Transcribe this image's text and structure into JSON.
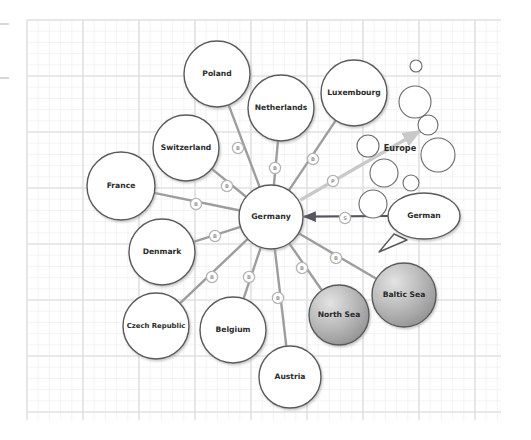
{
  "canvas": {
    "width": 531,
    "height": 440,
    "background": "#ffffff",
    "grid": {
      "minor_spacing": 11.2,
      "major_spacing": 56,
      "minor_color": "#f0f0f2",
      "major_color": "#e2e2e6",
      "left": 27,
      "top": 20,
      "right": 501,
      "bottom": 420
    },
    "margin_ticks": [
      {
        "x1": 0,
        "y": 24,
        "x2": 9,
        "color": "#bdbdbd"
      },
      {
        "x1": 0,
        "y": 78,
        "x2": 9,
        "color": "#bdbdbd"
      }
    ]
  },
  "diagram": {
    "type": "node-link-mindmap",
    "center_node": "Germany",
    "colors": {
      "node_stroke": "#5a5a5a",
      "node_fill": "#ffffff",
      "node_text": "#2b2b2b",
      "edge_default": "#9d9d9d",
      "edge_highlight_dark": "#555560",
      "edge_highlight_light": "#c9c9c9",
      "badge_stroke": "#b4b4b4",
      "badge_fill": "#ffffff",
      "badge_text": "#9a9a9a",
      "sea_fill_light": "#d9d9d9",
      "sea_fill_dark": "#8f8f8f",
      "sea_stroke": "#5a5a5a",
      "cluster_stroke": "#6b6b6b"
    },
    "nodes": [
      {
        "id": "germany",
        "label": "Germany",
        "cx": 271,
        "cy": 217,
        "r": 32,
        "style": "plain"
      },
      {
        "id": "poland",
        "label": "Poland",
        "cx": 217,
        "cy": 74,
        "r": 33,
        "style": "plain"
      },
      {
        "id": "netherlands",
        "label": "Netherlands",
        "cx": 281,
        "cy": 108,
        "r": 33,
        "style": "plain"
      },
      {
        "id": "luxembourg",
        "label": "Luxembourg",
        "cx": 354,
        "cy": 93,
        "r": 33,
        "style": "plain"
      },
      {
        "id": "switzerland",
        "label": "Switzerland",
        "cx": 186,
        "cy": 148,
        "r": 33,
        "style": "plain"
      },
      {
        "id": "france",
        "label": "France",
        "cx": 121,
        "cy": 186,
        "r": 34,
        "style": "plain"
      },
      {
        "id": "denmark",
        "label": "Denmark",
        "cx": 162,
        "cy": 252,
        "r": 33,
        "style": "plain"
      },
      {
        "id": "czech_republic",
        "label": "Czech Republic",
        "cx": 156,
        "cy": 326,
        "r": 33,
        "style": "plain"
      },
      {
        "id": "belgium",
        "label": "Belgium",
        "cx": 233,
        "cy": 330,
        "r": 33,
        "style": "plain"
      },
      {
        "id": "austria",
        "label": "Austria",
        "cx": 290,
        "cy": 377,
        "r": 31,
        "style": "plain"
      },
      {
        "id": "north_sea",
        "label": "North Sea",
        "cx": 339,
        "cy": 315,
        "r": 30,
        "style": "shaded"
      },
      {
        "id": "baltic_sea",
        "label": "Baltic Sea",
        "cx": 404,
        "cy": 295,
        "r": 32,
        "style": "shaded"
      }
    ],
    "speech_bubble": {
      "id": "german",
      "label": "German",
      "cx": 424,
      "cy": 216,
      "rx": 36,
      "ry": 23,
      "tail": "down-left"
    },
    "cluster": {
      "id": "europe",
      "label": "Europe",
      "label_x": 400,
      "label_y": 148,
      "bubbles": [
        {
          "cx": 415,
          "cy": 102,
          "r": 16
        },
        {
          "cx": 416,
          "cy": 66,
          "r": 6
        },
        {
          "cx": 428,
          "cy": 125,
          "r": 10
        },
        {
          "cx": 368,
          "cy": 146,
          "r": 11
        },
        {
          "cx": 438,
          "cy": 155,
          "r": 17
        },
        {
          "cx": 384,
          "cy": 173,
          "r": 14
        },
        {
          "cx": 411,
          "cy": 183,
          "r": 8
        },
        {
          "cx": 373,
          "cy": 204,
          "r": 14
        }
      ]
    },
    "edges": [
      {
        "id": "e-poland",
        "from": "poland",
        "to": "germany",
        "badge": "B",
        "badge_x": 238,
        "badge_y": 148,
        "style": "default"
      },
      {
        "id": "e-netherlands",
        "from": "netherlands",
        "to": "germany",
        "badge": "B",
        "badge_x": 275,
        "badge_y": 168,
        "style": "default"
      },
      {
        "id": "e-luxembourg",
        "from": "luxembourg",
        "to": "germany",
        "badge": "B",
        "badge_x": 313,
        "badge_y": 159,
        "style": "default"
      },
      {
        "id": "e-switzerland",
        "from": "switzerland",
        "to": "germany",
        "badge": "B",
        "badge_x": 227,
        "badge_y": 186,
        "style": "default"
      },
      {
        "id": "e-france",
        "from": "france",
        "to": "germany",
        "badge": "B",
        "badge_x": 196,
        "badge_y": 204,
        "style": "default"
      },
      {
        "id": "e-denmark",
        "from": "denmark",
        "to": "germany",
        "badge": "B",
        "badge_x": 215,
        "badge_y": 236,
        "style": "default"
      },
      {
        "id": "e-czech",
        "from": "czech_republic",
        "to": "germany",
        "badge": "B",
        "badge_x": 212,
        "badge_y": 277,
        "style": "default"
      },
      {
        "id": "e-belgium",
        "from": "belgium",
        "to": "germany",
        "badge": "B",
        "badge_x": 249,
        "badge_y": 277,
        "style": "default"
      },
      {
        "id": "e-austria",
        "from": "austria",
        "to": "germany",
        "badge": "B",
        "badge_x": 278,
        "badge_y": 298,
        "style": "default"
      },
      {
        "id": "e-northsea",
        "from": "north_sea",
        "to": "germany",
        "badge": "B",
        "badge_x": 302,
        "badge_y": 268,
        "style": "default"
      },
      {
        "id": "e-balticsea",
        "from": "baltic_sea",
        "to": "germany",
        "badge": "B",
        "badge_x": 336,
        "badge_y": 258,
        "style": "default"
      },
      {
        "id": "e-europe",
        "from": "germany",
        "to": "europe",
        "badge": "P",
        "badge_x": 333,
        "badge_y": 181,
        "style": "light-arrow"
      },
      {
        "id": "e-german",
        "from": "german",
        "to": "germany",
        "badge": "S",
        "badge_x": 345,
        "badge_y": 218,
        "style": "dark-arrow"
      }
    ],
    "legend": {
      "B": "B",
      "P": "P",
      "S": "S"
    }
  }
}
